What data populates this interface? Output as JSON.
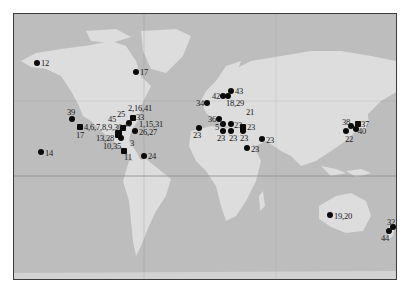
{
  "map": {
    "type": "world-map-site-locations",
    "colors": {
      "ocean": "#bdbdbd",
      "land": "#dddddd",
      "frame": "#3a3a3a",
      "marker": "#0a0a0a",
      "gridline": "#8c8c8c"
    },
    "gridlines": {
      "equator_y": 175,
      "meridian_x": 143
    },
    "sites": [
      {
        "label": "12",
        "x": 37,
        "y": 63
      },
      {
        "label": "17",
        "x": 136,
        "y": 72
      },
      {
        "label": "39",
        "x": 72,
        "y": 118
      },
      {
        "label": "4,6,7,8,9,30",
        "x": 80,
        "y": 127
      },
      {
        "label": "17",
        "x": 80,
        "y": 127
      },
      {
        "label": "45",
        "x": 115,
        "y": 124
      },
      {
        "label": "25",
        "x": 121,
        "y": 122
      },
      {
        "label": "2,16,41",
        "x": 133,
        "y": 116
      },
      {
        "label": "33",
        "x": 133,
        "y": 121
      },
      {
        "label": "43",
        "x": 128,
        "y": 127
      },
      {
        "label": "1,15,31",
        "x": 136,
        "y": 125
      },
      {
        "label": "26,27",
        "x": 135,
        "y": 131
      },
      {
        "label": "13,28",
        "x": 117,
        "y": 136
      },
      {
        "label": "3",
        "x": 124,
        "y": 139
      },
      {
        "label": "10,35",
        "x": 121,
        "y": 144
      },
      {
        "label": "11",
        "x": 124,
        "y": 151
      },
      {
        "label": "24",
        "x": 144,
        "y": 155
      },
      {
        "label": "14",
        "x": 41,
        "y": 152
      },
      {
        "label": "34",
        "x": 207,
        "y": 103
      },
      {
        "label": "42",
        "x": 223,
        "y": 95
      },
      {
        "label": "18,29",
        "x": 227,
        "y": 95
      },
      {
        "label": "43",
        "x": 231,
        "y": 91
      },
      {
        "label": "21",
        "x": 0,
        "y": 0
      },
      {
        "label": "36",
        "x": 219,
        "y": 119
      },
      {
        "label": "5",
        "x": 222,
        "y": 124
      },
      {
        "label": "23",
        "x": 231,
        "y": 124
      },
      {
        "label": "23",
        "x": 243,
        "y": 127
      },
      {
        "label": "23",
        "x": 222,
        "y": 131
      },
      {
        "label": "23",
        "x": 231,
        "y": 131
      },
      {
        "label": "23",
        "x": 243,
        "y": 131
      },
      {
        "label": "23",
        "x": 198,
        "y": 128
      },
      {
        "label": "23",
        "x": 262,
        "y": 139
      },
      {
        "label": "23",
        "x": 247,
        "y": 148
      },
      {
        "label": "38",
        "x": 351,
        "y": 125
      },
      {
        "label": "37",
        "x": 358,
        "y": 124
      },
      {
        "label": "40",
        "x": 356,
        "y": 129
      },
      {
        "label": "22",
        "x": 346,
        "y": 131
      },
      {
        "label": "19,20",
        "x": 330,
        "y": 215
      },
      {
        "label": "32",
        "x": 393,
        "y": 226
      },
      {
        "label": "44",
        "x": 389,
        "y": 231
      }
    ]
  }
}
